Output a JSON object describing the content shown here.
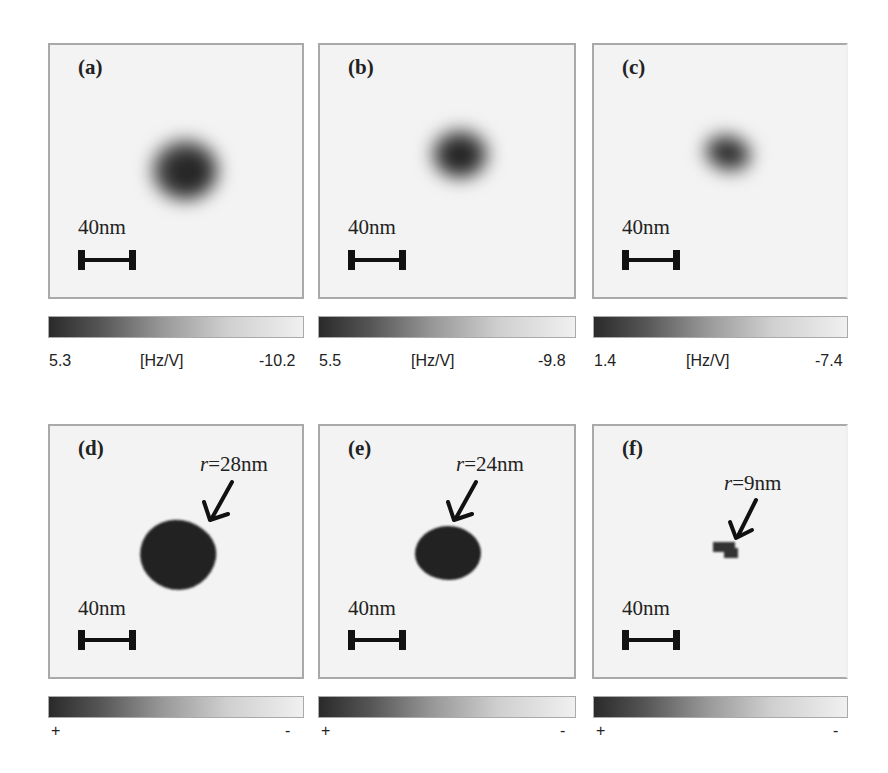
{
  "figure": {
    "scale_bar_label": "40nm",
    "top_row": [
      {
        "label": "(a)",
        "colorbar": {
          "min_label": "5.3",
          "unit": "[Hz/V]",
          "max_label": "-10.2"
        }
      },
      {
        "label": "(b)",
        "colorbar": {
          "min_label": "5.5",
          "unit": "[Hz/V]",
          "max_label": "-9.8"
        }
      },
      {
        "label": "(c)",
        "colorbar": {
          "min_label": "1.4",
          "unit": "[Hz/V]",
          "max_label": "-7.4"
        }
      }
    ],
    "bottom_row": [
      {
        "label": "(d)",
        "radius_var": "r",
        "radius_value": "=28nm",
        "colorbar": {
          "min_label": "+",
          "max_label": "-"
        }
      },
      {
        "label": "(e)",
        "radius_var": "r",
        "radius_value": "=24nm",
        "colorbar": {
          "min_label": "+",
          "max_label": "-"
        }
      },
      {
        "label": "(f)",
        "radius_var": "r",
        "radius_value": "=9nm",
        "colorbar": {
          "min_label": "+",
          "max_label": "-"
        }
      }
    ]
  },
  "colors": {
    "panel_bg": "#f3f3f3",
    "panel_border": "#a9a9a9",
    "feature_dark": "#1e1e1e",
    "colorbar_dark": "#2a2a2a",
    "colorbar_light": "#f0f0f0"
  }
}
